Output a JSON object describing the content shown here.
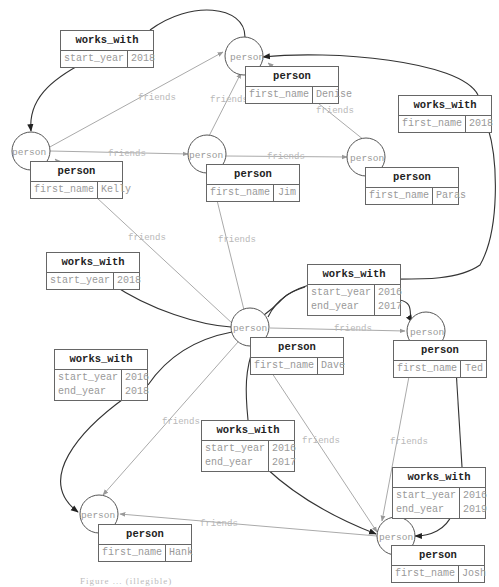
{
  "diagram": {
    "node_type_label": "person",
    "friend_edge_label": "friends",
    "nodes": [
      {
        "id": "denise",
        "x": 244,
        "y": 56,
        "table": {
          "x": 245,
          "y": 66,
          "w": 94,
          "title": "person",
          "keys": [
            "first_name"
          ],
          "vals": [
            "Denise"
          ]
        }
      },
      {
        "id": "kelly",
        "x": 31,
        "y": 151,
        "table": {
          "x": 30,
          "y": 161,
          "w": 93,
          "title": "person",
          "keys": [
            "first_name"
          ],
          "vals": [
            "Kelly"
          ]
        }
      },
      {
        "id": "jim",
        "x": 207,
        "y": 154,
        "table": {
          "x": 206,
          "y": 164,
          "w": 94,
          "title": "person",
          "keys": [
            "first_name"
          ],
          "vals": [
            "Jim"
          ]
        }
      },
      {
        "id": "paras",
        "x": 366,
        "y": 157,
        "table": {
          "x": 365,
          "y": 167,
          "w": 94,
          "title": "person",
          "keys": [
            "first_name"
          ],
          "vals": [
            "Paras"
          ]
        }
      },
      {
        "id": "dave",
        "x": 250,
        "y": 327,
        "table": {
          "x": 250,
          "y": 337,
          "w": 94,
          "title": "person",
          "keys": [
            "first_name"
          ],
          "vals": [
            "Dave"
          ]
        }
      },
      {
        "id": "ted",
        "x": 426,
        "y": 331,
        "table": {
          "x": 393,
          "y": 340,
          "w": 94,
          "title": "person",
          "keys": [
            "first_name"
          ],
          "vals": [
            "Ted"
          ]
        }
      },
      {
        "id": "hank",
        "x": 99,
        "y": 514,
        "table": {
          "x": 98,
          "y": 524,
          "w": 94,
          "title": "person",
          "keys": [
            "first_name"
          ],
          "vals": [
            "Hank"
          ]
        }
      },
      {
        "id": "josh",
        "x": 396,
        "y": 536,
        "table": {
          "x": 391,
          "y": 545,
          "w": 94,
          "title": "person",
          "keys": [
            "first_name"
          ],
          "vals": [
            "Josh"
          ]
        }
      }
    ],
    "relationship_tables": [
      {
        "id": "ww1",
        "x": 60,
        "y": 30,
        "w": 94,
        "title": "works_with",
        "keys": [
          "start_year"
        ],
        "vals": [
          "2018"
        ]
      },
      {
        "id": "ww2",
        "x": 398,
        "y": 95,
        "w": 94,
        "title": "works_with",
        "keys": [
          "first_name"
        ],
        "vals": [
          "2018"
        ]
      },
      {
        "id": "ww3",
        "x": 46,
        "y": 252,
        "w": 94,
        "title": "works_with",
        "keys": [
          "start_year"
        ],
        "vals": [
          "2018"
        ]
      },
      {
        "id": "ww4",
        "x": 307,
        "y": 264,
        "w": 94,
        "title": "works_with",
        "keys": [
          "start_year",
          "end_year"
        ],
        "vals": [
          "2016",
          "2017"
        ]
      },
      {
        "id": "ww5",
        "x": 54,
        "y": 349,
        "w": 94,
        "title": "works_with",
        "keys": [
          "start_year",
          "end_year"
        ],
        "vals": [
          "2016",
          "2018"
        ]
      },
      {
        "id": "ww6",
        "x": 201,
        "y": 420,
        "w": 94,
        "title": "works_with",
        "keys": [
          "start_year",
          "end_year"
        ],
        "vals": [
          "2016",
          "2017"
        ]
      },
      {
        "id": "ww7",
        "x": 392,
        "y": 467,
        "w": 94,
        "title": "works_with",
        "keys": [
          "start_year",
          "end_year"
        ],
        "vals": [
          "2016",
          "2019"
        ]
      }
    ],
    "caption": "Figure ... (illegible)"
  }
}
